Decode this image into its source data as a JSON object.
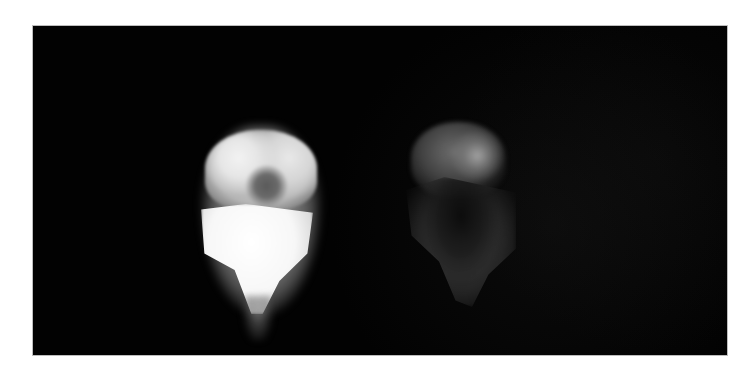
{
  "figure": {
    "type": "grayscale scintigraphy/fluorescence image",
    "background_color": "#020202",
    "frame_color": "#ffffff",
    "panels": [
      {
        "id": "left",
        "description": "bright saturated organ-shaped uptake region with darker central area"
      },
      {
        "id": "right",
        "description": "dim, speckled organ-shaped uptake region"
      }
    ]
  }
}
